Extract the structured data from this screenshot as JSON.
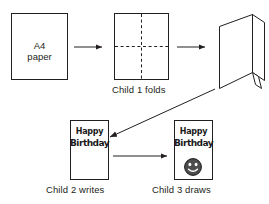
{
  "diagram": {
    "background_color": "#ffffff",
    "stroke_color": "#231f20",
    "steps": [
      {
        "id": "step-1",
        "shape": "portrait-sheet",
        "text_line1": "A4",
        "text_line2": "paper",
        "caption": ""
      },
      {
        "id": "step-2",
        "shape": "portrait-sheet-with-fold-lines",
        "fold_lines": [
          "vertical-dashed-center",
          "horizontal-dashed-center"
        ],
        "caption": "Child 1 folds"
      },
      {
        "id": "step-3",
        "shape": "standing-folded-card-3d",
        "caption": ""
      },
      {
        "id": "step-4",
        "shape": "card-front-with-text",
        "greeting_line1": "Happy",
        "greeting_line2": "Birthday",
        "caption": "Child 2 writes"
      },
      {
        "id": "step-5",
        "shape": "card-front-with-text-and-drawing",
        "greeting_line1": "Happy",
        "greeting_line2": "Birthday",
        "drawing": "smiley-face",
        "caption": "Child 3 draws"
      }
    ],
    "arrows": [
      {
        "id": "arrow-1",
        "from": "step-1",
        "to": "step-2",
        "direction": "right"
      },
      {
        "id": "arrow-2",
        "from": "step-2",
        "to": "step-3",
        "direction": "right"
      },
      {
        "id": "arrow-3",
        "from": "step-3",
        "to": "step-4",
        "direction": "diagonal-down-left"
      },
      {
        "id": "arrow-4",
        "from": "step-4",
        "to": "step-5",
        "direction": "right"
      }
    ]
  }
}
